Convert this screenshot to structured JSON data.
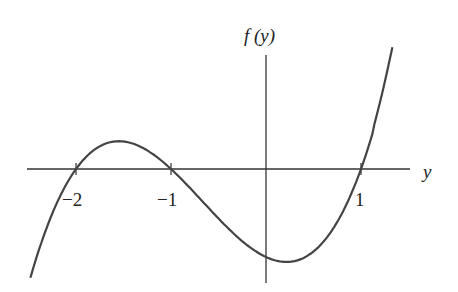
{
  "chart_data": {
    "type": "line",
    "title": "",
    "xlabel": "y",
    "ylabel": "f(y)",
    "function": "f(y) = (y + 2)(y + 1)(y - 1)",
    "roots": [
      -2,
      -1,
      1
    ],
    "x_ticks": [
      {
        "value": -2,
        "label": "−2"
      },
      {
        "value": -1,
        "label": "−1"
      },
      {
        "value": 1,
        "label": "1"
      }
    ],
    "xlim": [
      -2.5,
      1.5
    ],
    "ylim": [
      -2.6,
      3.0
    ],
    "grid": false,
    "legend": "none",
    "series": [
      {
        "name": "f(y)",
        "x": [
          -2.48,
          -2.25,
          -2.0,
          -1.75,
          -1.53,
          -1.25,
          -1.0,
          -0.75,
          -0.5,
          -0.25,
          0.0,
          0.22,
          0.5,
          0.75,
          1.0,
          1.15,
          1.31
        ],
        "values": [
          -2.47,
          -0.84,
          0.0,
          0.52,
          0.63,
          0.42,
          0.0,
          -0.55,
          -1.13,
          -1.64,
          -2.0,
          -2.11,
          -1.88,
          -1.2,
          0.0,
          0.93,
          2.37
        ]
      }
    ]
  },
  "labels": {
    "x_axis": "y",
    "y_axis": "f (y)",
    "tick_neg2": "−2",
    "tick_neg1": "−1",
    "tick_1": "1"
  },
  "colors": {
    "axis": "#333333",
    "curve": "#444444"
  }
}
